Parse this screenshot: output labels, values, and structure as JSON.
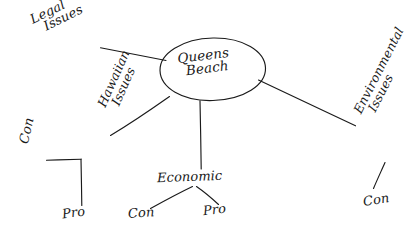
{
  "diagram": {
    "type": "mind-map",
    "title": "Queens Beach",
    "style": "hand-drawn sketch, black ink on white paper",
    "colors": {
      "background": "#ffffff",
      "ink": "#1a1a1a"
    },
    "center": {
      "label_line1": "Queens",
      "label_line2": "Beach",
      "shape": "ellipse"
    },
    "branches": [
      {
        "id": "legal",
        "label_line1": "Legal",
        "label_line2": "Issues",
        "children": []
      },
      {
        "id": "hawaiian",
        "label_line1": "Hawaiian",
        "label_line2": "Issues",
        "children": [
          {
            "id": "hawaiian-con",
            "label": "Con"
          },
          {
            "id": "hawaiian-pro",
            "label": "Pro"
          }
        ]
      },
      {
        "id": "economic",
        "label_line1": "Economic",
        "label_line2": "",
        "children": [
          {
            "id": "economic-con",
            "label": "Con"
          },
          {
            "id": "economic-pro",
            "label": "Pro"
          }
        ]
      },
      {
        "id": "environmental",
        "label_line1": "Environmental",
        "label_line2": "Issues",
        "children": [
          {
            "id": "environmental-con",
            "label": "Con"
          }
        ]
      }
    ]
  }
}
